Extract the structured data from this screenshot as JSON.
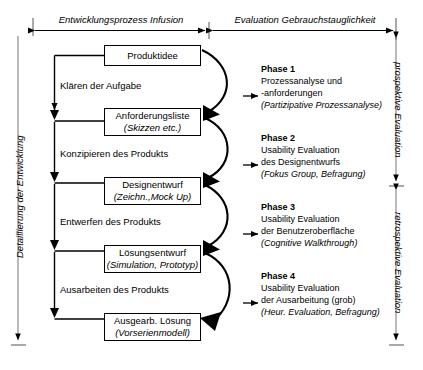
{
  "diagram": {
    "title_spans": [
      {
        "id": "development-process",
        "label": "Entwicklungsprozess  Infusion"
      },
      {
        "id": "usability-evaluation",
        "label": "Evaluation Gebrauchstauglichkeit"
      }
    ],
    "side_labels": {
      "left": "Detaillierung der Entwicklung",
      "right_upper": "prospektive Evaluation",
      "right_lower": "retrospektive Evaluation"
    },
    "process_boxes": [
      {
        "id": "produktidee",
        "main": "Produktidee",
        "sub": ""
      },
      {
        "id": "anforderungsliste",
        "main": "Anforderungsliste",
        "sub": "(Skizzen etc.)"
      },
      {
        "id": "designentwurf",
        "main": "Designentwurf",
        "sub": "(Zeichn.,Mock Up)"
      },
      {
        "id": "loesungsentwurf",
        "main": "Lösungsentwurf",
        "sub": "(Simulation, Prototyp)"
      },
      {
        "id": "ausgearb-loesung",
        "main": "Ausgearb. Lösung",
        "sub": "(Vorserienmodell)"
      }
    ],
    "activities": [
      {
        "id": "klaeren-der-aufgabe",
        "label": "Klären der Aufgabe"
      },
      {
        "id": "konzipieren-des-produkts",
        "label": "Konzipieren des Produkts"
      },
      {
        "id": "entwerfen-des-produkts",
        "label": "Entwerfen des Produkts"
      },
      {
        "id": "ausarbeiten-des-produkts",
        "label": "Ausarbeiten des Produkts"
      }
    ],
    "phases": [
      {
        "id": "phase-1",
        "title": "Phase 1",
        "line1": "Prozessanalyse und",
        "line2": "-anforderungen",
        "method": "(Partizipative Prozessanalyse)"
      },
      {
        "id": "phase-2",
        "title": "Phase 2",
        "line1": "Usability Evaluation",
        "line2": "des Designentwurfs",
        "method": "(Fokus Group, Befragung)"
      },
      {
        "id": "phase-3",
        "title": "Phase 3",
        "line1": "Usability Evaluation",
        "line2": "der Benutzeroberfläche",
        "method": "(Cognitive Walkthrough)"
      },
      {
        "id": "phase-4",
        "title": "Phase 4",
        "line1": "Usability Evaluation",
        "line2": "der Ausarbeitung (grob)",
        "method": "(Heur. Evaluation, Befragung)"
      }
    ],
    "colors": {
      "stroke": "#000000",
      "background": "#ffffff",
      "axis": "#444444"
    }
  }
}
